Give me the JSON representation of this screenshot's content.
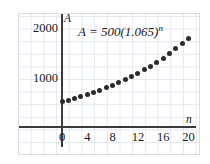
{
  "chart_data": {
    "type": "scatter",
    "title": "",
    "equation_label": "A = 500(1.065)",
    "equation_exponent": "n",
    "xlabel": "n",
    "ylabel": "A",
    "xlim": [
      -1,
      21
    ],
    "ylim": [
      0,
      2200
    ],
    "grid": true,
    "legend": null,
    "xticks": [
      "0",
      "4",
      "8",
      "12",
      "16",
      "20"
    ],
    "xtick_values": [
      0,
      4,
      8,
      12,
      16,
      20
    ],
    "yticks": [
      "1000",
      "2000"
    ],
    "ytick_values": [
      1000,
      2000
    ],
    "x": [
      0,
      1,
      2,
      3,
      4,
      5,
      6,
      7,
      8,
      9,
      10,
      11,
      12,
      13,
      14,
      15,
      16,
      17,
      18,
      19,
      20
    ],
    "values": [
      500,
      533,
      567,
      604,
      643,
      685,
      729,
      777,
      827,
      881,
      938,
      999,
      1064,
      1133,
      1206,
      1285,
      1368,
      1457,
      1552,
      1652,
      1759
    ],
    "point_color": "#2b2b2b",
    "grid_color": "#e3e9f1",
    "axis_color": "#3b3b3b"
  }
}
